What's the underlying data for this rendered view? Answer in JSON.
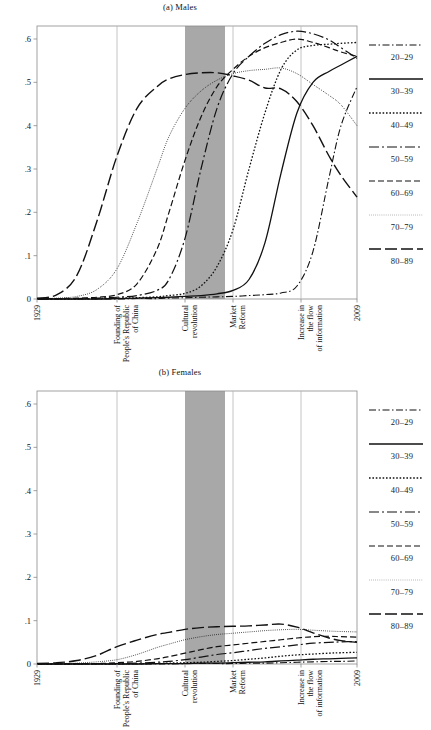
{
  "figure": {
    "panels": [
      {
        "id": "males",
        "title": "(a) Males"
      },
      {
        "id": "females",
        "title": "(b) Females"
      }
    ]
  },
  "legend": {
    "entries": [
      {
        "label": "20–29",
        "style": "dashdot-short",
        "dash": "7,2.5,1.5,2.5",
        "width": 1.1
      },
      {
        "label": "30–39",
        "style": "solid",
        "dash": "none",
        "width": 1.3
      },
      {
        "label": "40–49",
        "style": "dotted",
        "dash": "1.6,1.8",
        "width": 1.3
      },
      {
        "label": "50–59",
        "style": "longdash-dot",
        "dash": "10,3,2,3",
        "width": 1.2
      },
      {
        "label": "60–69",
        "style": "dashed",
        "dash": "6,3",
        "width": 1.2
      },
      {
        "label": "70–79",
        "style": "fine-dotted",
        "dash": "0.7,1.4",
        "width": 1.0
      },
      {
        "label": "80–89",
        "style": "longdash",
        "dash": "12,4",
        "width": 1.4
      }
    ]
  },
  "chart_data": {
    "type": "line",
    "xlabel": "",
    "ylabel": "",
    "xlim": [
      1929,
      2009
    ],
    "ylim": [
      0,
      0.63
    ],
    "yticks": [
      0,
      0.1,
      0.2,
      0.3,
      0.4,
      0.5,
      0.6
    ],
    "ytick_labels": [
      "0",
      ".1",
      ".2",
      ".3",
      ".4",
      ".5",
      ".6"
    ],
    "xticks": [
      1929,
      1949,
      1966,
      1978,
      1995,
      2009
    ],
    "xtick_labels": [
      "1929",
      "Founding of People's Republic of China",
      "Cultural revolution",
      "Market Reform",
      "Increase in the flow of information",
      "2009"
    ],
    "grid": false,
    "legend_position": "right",
    "annotations": {
      "shaded_band": {
        "label": "Cultural revolution",
        "x_start": 1966,
        "x_end": 1976,
        "color": "#a8a8a8"
      },
      "vertical_lines": [
        {
          "label": "Founding of People's Republic of China",
          "x": 1949
        },
        {
          "label": "Market Reform",
          "x": 1978
        },
        {
          "label": "Increase in the flow of information",
          "x": 1995
        }
      ]
    },
    "panels": [
      {
        "name": "(a) Males",
        "x": [
          1929,
          1934,
          1939,
          1944,
          1949,
          1954,
          1959,
          1962,
          1966,
          1970,
          1974,
          1978,
          1982,
          1986,
          1990,
          1994,
          1998,
          2002,
          2005,
          2009
        ],
        "series": [
          {
            "name": "80–89",
            "values": [
              0.002,
              0.01,
              0.055,
              0.18,
              0.33,
              0.44,
              0.49,
              0.508,
              0.518,
              0.522,
              0.522,
              0.515,
              0.505,
              0.487,
              0.485,
              0.455,
              0.4,
              0.33,
              0.285,
              0.235
            ]
          },
          {
            "name": "70–79",
            "values": [
              0.001,
              0.002,
              0.006,
              0.022,
              0.07,
              0.175,
              0.3,
              0.375,
              0.44,
              0.48,
              0.505,
              0.52,
              0.527,
              0.53,
              0.533,
              0.52,
              0.495,
              0.47,
              0.448,
              0.4
            ]
          },
          {
            "name": "60–69",
            "values": [
              0.0,
              0.001,
              0.002,
              0.004,
              0.01,
              0.035,
              0.115,
              0.2,
              0.32,
              0.42,
              0.49,
              0.53,
              0.56,
              0.58,
              0.592,
              0.6,
              0.592,
              0.58,
              0.57,
              0.56
            ]
          },
          {
            "name": "50–59",
            "values": [
              0.0,
              0.0,
              0.001,
              0.002,
              0.004,
              0.008,
              0.02,
              0.045,
              0.14,
              0.3,
              0.44,
              0.52,
              0.56,
              0.59,
              0.61,
              0.618,
              0.612,
              0.598,
              0.58,
              0.555
            ]
          },
          {
            "name": "40–49",
            "values": [
              0.0,
              0.0,
              0.0,
              0.001,
              0.002,
              0.003,
              0.005,
              0.008,
              0.013,
              0.03,
              0.075,
              0.16,
              0.3,
              0.43,
              0.53,
              0.575,
              0.585,
              0.588,
              0.59,
              0.592
            ]
          },
          {
            "name": "30–39",
            "values": [
              0.0,
              0.0,
              0.0,
              0.0,
              0.001,
              0.002,
              0.003,
              0.004,
              0.006,
              0.008,
              0.012,
              0.02,
              0.045,
              0.13,
              0.29,
              0.43,
              0.5,
              0.525,
              0.54,
              0.56
            ]
          },
          {
            "name": "20–29",
            "values": [
              0.0,
              0.0,
              0.0,
              0.0,
              0.0,
              0.001,
              0.001,
              0.002,
              0.003,
              0.004,
              0.005,
              0.006,
              0.008,
              0.01,
              0.014,
              0.03,
              0.11,
              0.28,
              0.4,
              0.49
            ]
          }
        ]
      },
      {
        "name": "(b) Females",
        "x": [
          1929,
          1934,
          1939,
          1944,
          1949,
          1954,
          1959,
          1962,
          1966,
          1970,
          1974,
          1978,
          1982,
          1986,
          1990,
          1994,
          1998,
          2002,
          2005,
          2009
        ],
        "series": [
          {
            "name": "80–89",
            "values": [
              0.001,
              0.003,
              0.008,
              0.02,
              0.04,
              0.055,
              0.068,
              0.073,
              0.08,
              0.084,
              0.086,
              0.087,
              0.088,
              0.09,
              0.092,
              0.085,
              0.072,
              0.06,
              0.054,
              0.05
            ]
          },
          {
            "name": "70–79",
            "values": [
              0.0,
              0.001,
              0.002,
              0.005,
              0.01,
              0.022,
              0.038,
              0.046,
              0.056,
              0.063,
              0.068,
              0.071,
              0.074,
              0.077,
              0.079,
              0.08,
              0.078,
              0.076,
              0.075,
              0.074
            ]
          },
          {
            "name": "60–69",
            "values": [
              0.0,
              0.0,
              0.001,
              0.001,
              0.003,
              0.006,
              0.012,
              0.017,
              0.025,
              0.033,
              0.04,
              0.044,
              0.048,
              0.052,
              0.056,
              0.06,
              0.063,
              0.064,
              0.063,
              0.062
            ]
          },
          {
            "name": "50–59",
            "values": [
              0.0,
              0.0,
              0.0,
              0.001,
              0.001,
              0.002,
              0.004,
              0.006,
              0.01,
              0.016,
              0.022,
              0.026,
              0.031,
              0.036,
              0.04,
              0.044,
              0.048,
              0.05,
              0.051,
              0.052
            ]
          },
          {
            "name": "40–49",
            "values": [
              0.0,
              0.0,
              0.0,
              0.0,
              0.0,
              0.001,
              0.001,
              0.002,
              0.003,
              0.004,
              0.006,
              0.008,
              0.011,
              0.014,
              0.018,
              0.021,
              0.023,
              0.025,
              0.026,
              0.027
            ]
          },
          {
            "name": "30–39",
            "values": [
              0.0,
              0.0,
              0.0,
              0.0,
              0.0,
              0.0,
              0.001,
              0.001,
              0.001,
              0.002,
              0.002,
              0.003,
              0.004,
              0.005,
              0.007,
              0.009,
              0.011,
              0.012,
              0.013,
              0.014
            ]
          },
          {
            "name": "20–29",
            "values": [
              0.0,
              0.0,
              0.0,
              0.0,
              0.0,
              0.0,
              0.0,
              0.0,
              0.001,
              0.001,
              0.001,
              0.001,
              0.002,
              0.002,
              0.003,
              0.004,
              0.005,
              0.006,
              0.006,
              0.007
            ]
          }
        ]
      }
    ]
  }
}
